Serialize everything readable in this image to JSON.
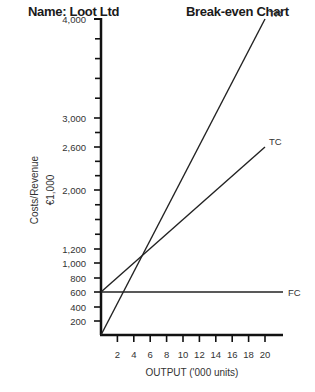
{
  "header": {
    "name_label": "Name: Loot Ltd",
    "chart_title": "Break-even Chart"
  },
  "chart_data": {
    "type": "line",
    "title": "Break-even Chart",
    "subtitle": "Name: Loot Ltd",
    "xlabel": "OUTPUT ('000 units)",
    "ylabel": "Costs/Revenue",
    "ylabel_unit": "€1,000",
    "x_ticks": [
      2,
      4,
      6,
      8,
      10,
      12,
      14,
      16,
      18,
      20
    ],
    "y_tick_labels": [
      "200",
      "400",
      "600",
      "800",
      "1,000",
      "1,200",
      "2,000",
      "2,600",
      "3,000",
      "4,000"
    ],
    "y_ticks": [
      200,
      400,
      600,
      800,
      1000,
      1200,
      2000,
      2600,
      3000,
      4000
    ],
    "xlim": [
      0,
      20
    ],
    "ylim": [
      0,
      4000
    ],
    "grid": false,
    "legend": "inline labels at line ends",
    "series": [
      {
        "name": "TR",
        "x": [
          0,
          20
        ],
        "values": [
          0,
          4000
        ]
      },
      {
        "name": "TC",
        "x": [
          0,
          20
        ],
        "values": [
          600,
          2600
        ]
      },
      {
        "name": "FC",
        "x": [
          0,
          22
        ],
        "values": [
          600,
          600
        ]
      }
    ],
    "break_even": {
      "x": 6,
      "y": 1200
    }
  }
}
